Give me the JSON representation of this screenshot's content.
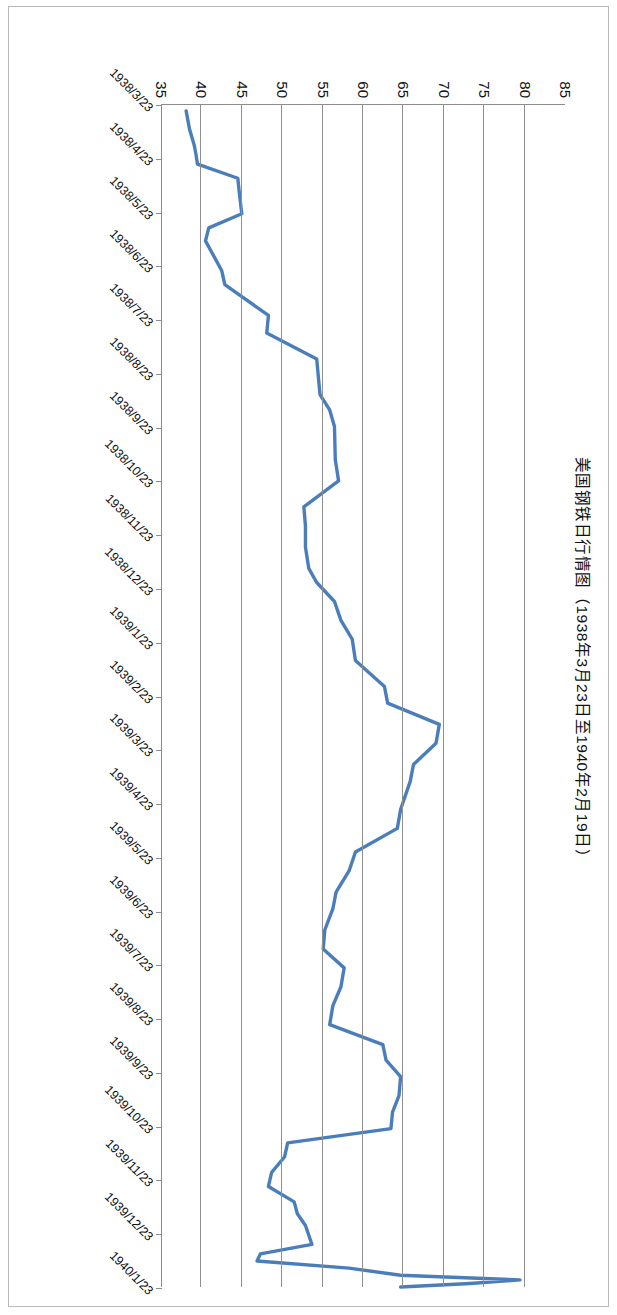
{
  "chart_data": {
    "type": "line",
    "title": "美国钢铁日行情图（1938年3月23日至1940年2月19日）",
    "xlabel": "",
    "ylabel": "",
    "ylim": [
      35,
      85
    ],
    "ytick_step": 5,
    "ytick_labels": [
      "85",
      "80",
      "75",
      "70",
      "65",
      "60",
      "55",
      "50",
      "45",
      "40",
      "35"
    ],
    "grid": "value-axis gridlines only",
    "legend": "none",
    "line_color": "#4a7ebb",
    "axis_color": "#8c8c8c",
    "x_tick_labels": [
      "1938/3/23",
      "1938/4/23",
      "1938/5/23",
      "1938/6/23",
      "1938/7/23",
      "1938/8/23",
      "1938/9/23",
      "1938/10/23",
      "1938/11/23",
      "1938/12/23",
      "1939/1/23",
      "1939/2/23",
      "1939/3/23",
      "1939/4/23",
      "1939/5/23",
      "1939/6/23",
      "1939/7/23",
      "1939/8/23",
      "1939/9/23",
      "1939/10/23",
      "1939/11/23",
      "1939/12/23",
      "1940/1/23"
    ],
    "x": [
      "1938/3/23",
      "1938/4/8",
      "1938/4/23",
      "1938/5/8",
      "1938/5/23",
      "1938/6/8",
      "1938/6/23",
      "1938/7/8",
      "1938/7/23",
      "1938/8/8",
      "1938/8/23",
      "1938/9/8",
      "1938/9/23",
      "1938/10/8",
      "1938/10/23",
      "1938/11/8",
      "1938/11/23",
      "1938/12/8",
      "1938/12/23",
      "1939/1/8",
      "1939/1/23",
      "1939/2/8",
      "1939/2/23",
      "1939/3/8",
      "1939/3/23",
      "1939/4/8",
      "1939/4/23",
      "1939/5/8",
      "1939/5/23",
      "1939/6/8",
      "1939/6/23",
      "1939/7/8",
      "1939/7/23",
      "1939/8/8",
      "1939/8/23",
      "1939/9/8",
      "1939/9/23",
      "1939/10/8",
      "1939/10/23",
      "1939/11/8",
      "1939/11/23",
      "1939/12/8",
      "1939/12/23",
      "1940/1/8",
      "1940/1/23",
      "1940/2/19"
    ],
    "values": [
      38.0,
      38.5,
      39.5,
      44.5,
      44.8,
      40.5,
      42.5,
      48.0,
      54.0,
      56.5,
      57.0,
      53.0,
      52.5,
      52.8,
      56.5,
      58.5,
      62.5,
      69.5,
      66.0,
      64.5,
      59.0,
      56.5,
      55.0,
      57.5,
      56.0,
      62.5,
      64.5,
      63.5,
      50.5,
      48.5,
      51.5,
      52.5,
      53.5,
      47.0,
      46.5,
      58.0,
      64.5,
      79.5,
      73.0,
      75.5,
      74.0,
      72.5,
      66.5,
      64.5,
      67.0,
      64.5
    ],
    "series_points": [
      {
        "t": 0.005,
        "v": 38.0
      },
      {
        "t": 0.02,
        "v": 38.4
      },
      {
        "t": 0.034,
        "v": 39.0
      },
      {
        "t": 0.041,
        "v": 39.2
      },
      {
        "t": 0.05,
        "v": 39.4
      },
      {
        "t": 0.062,
        "v": 44.4
      },
      {
        "t": 0.075,
        "v": 44.6
      },
      {
        "t": 0.092,
        "v": 44.9
      },
      {
        "t": 0.104,
        "v": 40.8
      },
      {
        "t": 0.115,
        "v": 40.4
      },
      {
        "t": 0.14,
        "v": 42.4
      },
      {
        "t": 0.152,
        "v": 42.8
      },
      {
        "t": 0.178,
        "v": 48.2
      },
      {
        "t": 0.193,
        "v": 48.0
      },
      {
        "t": 0.215,
        "v": 54.2
      },
      {
        "t": 0.245,
        "v": 54.6
      },
      {
        "t": 0.258,
        "v": 55.8
      },
      {
        "t": 0.272,
        "v": 56.4
      },
      {
        "t": 0.3,
        "v": 56.5
      },
      {
        "t": 0.318,
        "v": 56.9
      },
      {
        "t": 0.34,
        "v": 52.6
      },
      {
        "t": 0.356,
        "v": 52.8
      },
      {
        "t": 0.374,
        "v": 52.8
      },
      {
        "t": 0.392,
        "v": 53.2
      },
      {
        "t": 0.404,
        "v": 54.2
      },
      {
        "t": 0.42,
        "v": 56.4
      },
      {
        "t": 0.436,
        "v": 57.2
      },
      {
        "t": 0.452,
        "v": 58.6
      },
      {
        "t": 0.47,
        "v": 59.0
      },
      {
        "t": 0.492,
        "v": 62.6
      },
      {
        "t": 0.506,
        "v": 63.0
      },
      {
        "t": 0.524,
        "v": 69.4
      },
      {
        "t": 0.54,
        "v": 69.0
      },
      {
        "t": 0.558,
        "v": 66.2
      },
      {
        "t": 0.572,
        "v": 65.8
      },
      {
        "t": 0.596,
        "v": 64.6
      },
      {
        "t": 0.612,
        "v": 64.2
      },
      {
        "t": 0.632,
        "v": 59.0
      },
      {
        "t": 0.648,
        "v": 58.2
      },
      {
        "t": 0.666,
        "v": 56.6
      },
      {
        "t": 0.68,
        "v": 56.2
      },
      {
        "t": 0.698,
        "v": 55.2
      },
      {
        "t": 0.714,
        "v": 55.0
      },
      {
        "t": 0.73,
        "v": 57.6
      },
      {
        "t": 0.746,
        "v": 57.2
      },
      {
        "t": 0.762,
        "v": 56.2
      },
      {
        "t": 0.778,
        "v": 55.8
      },
      {
        "t": 0.795,
        "v": 62.4
      },
      {
        "t": 0.808,
        "v": 62.8
      },
      {
        "t": 0.822,
        "v": 64.6
      },
      {
        "t": 0.838,
        "v": 64.4
      },
      {
        "t": 0.852,
        "v": 63.6
      },
      {
        "t": 0.866,
        "v": 63.4
      },
      {
        "t": 0.878,
        "v": 50.6
      },
      {
        "t": 0.89,
        "v": 50.2
      },
      {
        "t": 0.903,
        "v": 48.6
      },
      {
        "t": 0.915,
        "v": 48.2
      },
      {
        "t": 0.928,
        "v": 51.4
      },
      {
        "t": 0.938,
        "v": 51.8
      },
      {
        "t": 0.948,
        "v": 52.8
      },
      {
        "t": 0.956,
        "v": 53.2
      },
      {
        "t": 0.964,
        "v": 53.6
      },
      {
        "t": 0.972,
        "v": 47.2
      },
      {
        "t": 0.978,
        "v": 46.8
      },
      {
        "t": 0.984,
        "v": 58.2
      },
      {
        "t": 0.99,
        "v": 64.6
      },
      {
        "t": 0.994,
        "v": 79.4
      },
      {
        "t": 0.997,
        "v": 73.2
      },
      {
        "t": 1.0,
        "v": 64.6
      }
    ]
  },
  "chart": {
    "title": "美国钢铁日行情图（1938年3月23日至1940年2月19日）"
  }
}
